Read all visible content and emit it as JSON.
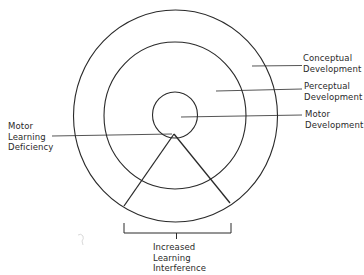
{
  "diagram": {
    "type": "concentric-circles",
    "rings": [
      {
        "name": "Motor Development",
        "level": "inner"
      },
      {
        "name": "Perceptual Development",
        "level": "middle"
      },
      {
        "name": "Conceptual Development",
        "level": "outer"
      }
    ],
    "colors": {
      "stroke": "#2a2a2a",
      "background": "#ffffff",
      "text": "#2a2a2a"
    }
  },
  "labels": {
    "conceptual": {
      "line1": "Conceptual",
      "line2": "Development"
    },
    "perceptual": {
      "line1": "Perceptual",
      "line2": "Development"
    },
    "motor": {
      "line1": "Motor",
      "line2": "Development"
    },
    "deficiency": {
      "line1": "Motor",
      "line2": "Learning",
      "line3": "Deficiency"
    },
    "interference": {
      "line1": "Increased",
      "line2": "Learning",
      "line3": "Interference"
    }
  }
}
